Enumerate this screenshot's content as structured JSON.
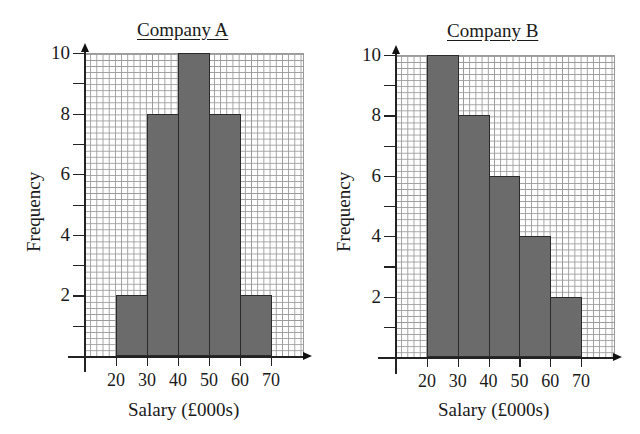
{
  "chart_data": [
    {
      "type": "bar",
      "subtype": "histogram",
      "title": "Company A",
      "xlabel": "Salary (£000s)",
      "ylabel": "Frequency",
      "bins": [
        [
          20,
          30
        ],
        [
          30,
          40
        ],
        [
          40,
          50
        ],
        [
          50,
          60
        ],
        [
          60,
          70
        ]
      ],
      "categories": [
        "20-30",
        "30-40",
        "40-50",
        "50-60",
        "60-70"
      ],
      "values": [
        2,
        8,
        10,
        8,
        2
      ],
      "x_ticks": [
        "20",
        "30",
        "40",
        "50",
        "60",
        "70"
      ],
      "y_ticks": [
        "2",
        "4",
        "6",
        "8",
        "10"
      ],
      "ylim": [
        0,
        10
      ],
      "xlim": [
        10,
        80
      ],
      "grid": true,
      "bar_color": "#6b6b6b"
    },
    {
      "type": "bar",
      "subtype": "histogram",
      "title": "Company B",
      "xlabel": "Salary (£000s)",
      "ylabel": "Frequency",
      "bins": [
        [
          20,
          30
        ],
        [
          30,
          40
        ],
        [
          40,
          50
        ],
        [
          50,
          60
        ],
        [
          60,
          70
        ]
      ],
      "categories": [
        "20-30",
        "30-40",
        "40-50",
        "50-60",
        "60-70"
      ],
      "values": [
        10,
        8,
        6,
        4,
        2
      ],
      "x_ticks": [
        "20",
        "30",
        "40",
        "50",
        "60",
        "70"
      ],
      "y_ticks": [
        "2",
        "4",
        "6",
        "8",
        "10"
      ],
      "ylim": [
        0,
        10
      ],
      "xlim": [
        10,
        80
      ],
      "grid": true,
      "bar_color": "#6b6b6b"
    }
  ]
}
